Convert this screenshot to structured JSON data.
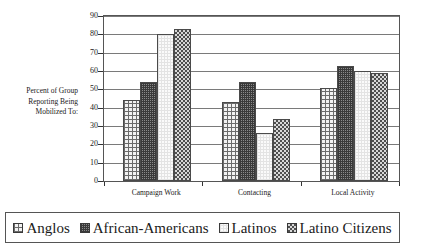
{
  "chart_data": {
    "type": "bar",
    "title": "",
    "xlabel": "",
    "ylabel": "Percent of Group Reporting Being Mobilized To:",
    "ylim": [
      0,
      90
    ],
    "ytick_step": 10,
    "yticks": [
      "0",
      "10",
      "20",
      "30",
      "40",
      "50",
      "60",
      "70",
      "80",
      "90"
    ],
    "grid": true,
    "legend_position": "bottom",
    "categories": [
      "Campaign Work",
      "Contacting",
      "Local Activity"
    ],
    "series": [
      {
        "name": "Anglos",
        "pattern": "light-crosshatch",
        "values": [
          44,
          43,
          51
        ]
      },
      {
        "name": "African-Americans",
        "pattern": "dark-fine-grid",
        "values": [
          54,
          54,
          63
        ]
      },
      {
        "name": "Latinos",
        "pattern": "white-plain",
        "values": [
          80,
          26,
          60
        ]
      },
      {
        "name": "Latino Citizens",
        "pattern": "dark-checker",
        "values": [
          83,
          34,
          59
        ]
      }
    ]
  },
  "axis_title": {
    "line1": "Percent of Group",
    "line2": "Reporting Being",
    "line3": "Mobilized To:"
  },
  "colors": {
    "frame": "#555555",
    "gridline": "#7a7a7a",
    "bar_outline": "#4a4a4a",
    "text": "#1a1a1a",
    "background": "#ffffff"
  }
}
